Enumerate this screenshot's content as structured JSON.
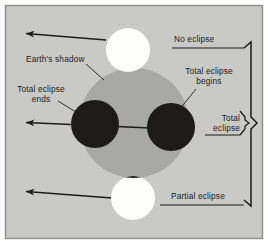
{
  "figure": {
    "background_color": "#c9c9c6",
    "frame_color": "#8e8e8a",
    "shadow_color": "#a8a8a5",
    "moon_lit_color": "#fdfdfb",
    "moon_dark_color": "#1e1a18",
    "line_color": "#1b1b1b"
  },
  "labels": {
    "no_eclipse": "No eclipse",
    "earths_shadow": "Earth's shadow",
    "total_eclipse_begins_line1": "Total eclipse",
    "total_eclipse_begins_line2": "begins",
    "total_eclipse_ends_line1": "Total eclipse",
    "total_eclipse_ends_line2": "ends",
    "total_eclipse_line1": "Total",
    "total_eclipse_line2": "eclipse",
    "partial_eclipse": "Partial eclipse"
  },
  "diagram": {
    "shadow_circle": {
      "cx": 134,
      "cy": 123,
      "r": 55
    },
    "moons": [
      {
        "name": "moon-no-eclipse",
        "cx": 128,
        "cy": 50,
        "r": 22,
        "state": "lit"
      },
      {
        "name": "moon-total-begins",
        "cx": 171,
        "cy": 127,
        "r": 24,
        "state": "dark"
      },
      {
        "name": "moon-total-ends",
        "cx": 95,
        "cy": 124,
        "r": 24,
        "state": "dark"
      },
      {
        "name": "moon-partial-eclipse",
        "cx": 133,
        "cy": 198,
        "r": 22,
        "state": "partial"
      }
    ],
    "arrows": [
      {
        "name": "arrow-no-eclipse",
        "x1": 106,
        "y1": 40,
        "x2": 24,
        "y2": 33
      },
      {
        "name": "arrow-total-eclipse",
        "x1": 148,
        "y1": 128,
        "x2": 24,
        "y2": 122
      },
      {
        "name": "arrow-partial-eclipse",
        "x1": 112,
        "y1": 198,
        "x2": 24,
        "y2": 191
      }
    ]
  }
}
